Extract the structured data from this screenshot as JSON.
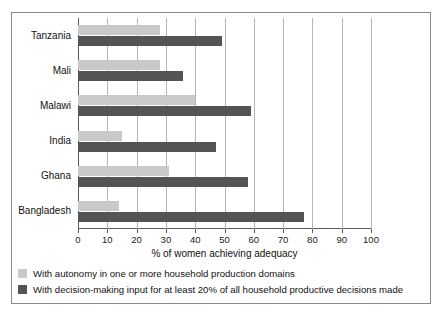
{
  "chart_data": {
    "type": "bar",
    "orientation": "horizontal",
    "title": "",
    "xlabel": "% of women achieving adequacy",
    "ylabel": "",
    "xlim": [
      0,
      100
    ],
    "xticks": [
      0,
      10,
      20,
      30,
      40,
      50,
      60,
      70,
      80,
      90,
      100
    ],
    "grid": "vertical",
    "legend_position": "below-plot",
    "categories": [
      "Tanzania",
      "Mali",
      "Malawi",
      "India",
      "Ghana",
      "Bangladesh"
    ],
    "series": [
      {
        "name": "With autonomy in one or more household production domains",
        "color": "#c9c9c9",
        "values": [
          28,
          28,
          40,
          15,
          31,
          14
        ]
      },
      {
        "name": "With decision-making input for at least 20% of all household productive decisions made",
        "color": "#545454",
        "values": [
          49,
          36,
          59,
          47,
          58,
          77
        ]
      }
    ]
  },
  "axis": {
    "x_title": "% of women achieving adequacy",
    "tick_labels": [
      "0",
      "10",
      "20",
      "30",
      "40",
      "50",
      "60",
      "70",
      "80",
      "90",
      "100"
    ]
  },
  "categories": [
    {
      "label": "Tanzania"
    },
    {
      "label": "Mali"
    },
    {
      "label": "Malawi"
    },
    {
      "label": "India"
    },
    {
      "label": "Ghana"
    },
    {
      "label": "Bangladesh"
    }
  ],
  "legend": {
    "items": [
      {
        "label": "With autonomy in one or more household production domains",
        "color": "#c9c9c9"
      },
      {
        "label": "With decision-making input for at least 20% of all household productive decisions made",
        "color": "#545454"
      }
    ]
  }
}
